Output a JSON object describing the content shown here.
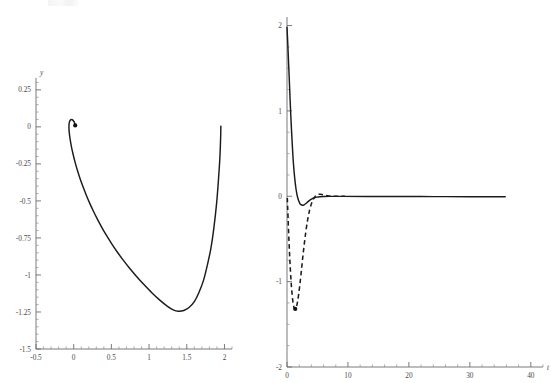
{
  "figure": {
    "background_color": "#ffffff",
    "axis_color": "#6b6b72",
    "curve_color": "#1b1b1e",
    "width": 551,
    "height": 383,
    "panel_count": 2
  },
  "chart_data": [
    {
      "id": "left-panel",
      "type": "line",
      "title": "",
      "subtitle": "",
      "xlabel": "",
      "ylabel": "y",
      "xlim": [
        -0.5,
        2.1
      ],
      "ylim": [
        -1.5,
        0.33
      ],
      "grid": false,
      "legend": null,
      "x_ticks_major": [
        -0.5,
        0,
        0.5,
        1,
        1.5,
        2
      ],
      "x_tick_labels": [
        "-0.5",
        "0",
        "0.5",
        "1",
        "1.5",
        "2"
      ],
      "x_minor_step": 0.1,
      "y_ticks_major": [
        -1.5,
        -1.25,
        -1,
        -0.75,
        -0.5,
        -0.25,
        0,
        0.25
      ],
      "y_tick_labels": [
        "-1.5",
        "-1.25",
        "-1",
        "-0.75",
        "-0.5",
        "-0.25",
        "0",
        "0.25"
      ],
      "y_minor_step": 0.05,
      "annotations": [
        {
          "name": "trajectory-endpoint-marker",
          "x": 0.02,
          "y": 0.01,
          "shape": "dot"
        }
      ],
      "series": [
        {
          "name": "phase-trajectory",
          "style": "solid",
          "color": "#1b1b1e",
          "points": [
            [
              0.02,
              0.012
            ],
            [
              0.006,
              0.034
            ],
            [
              -0.018,
              0.048
            ],
            [
              -0.042,
              0.047
            ],
            [
              -0.058,
              0.03
            ],
            [
              -0.063,
              0.002
            ],
            [
              -0.06,
              -0.034
            ],
            [
              -0.048,
              -0.081
            ],
            [
              -0.031,
              -0.131
            ],
            [
              -0.008,
              -0.185
            ],
            [
              0.019,
              -0.24
            ],
            [
              0.05,
              -0.295
            ],
            [
              0.085,
              -0.35
            ],
            [
              0.124,
              -0.405
            ],
            [
              0.166,
              -0.46
            ],
            [
              0.212,
              -0.515
            ],
            [
              0.262,
              -0.57
            ],
            [
              0.316,
              -0.625
            ],
            [
              0.374,
              -0.68
            ],
            [
              0.437,
              -0.735
            ],
            [
              0.505,
              -0.79
            ],
            [
              0.578,
              -0.845
            ],
            [
              0.657,
              -0.9
            ],
            [
              0.742,
              -0.955
            ],
            [
              0.834,
              -1.01
            ],
            [
              0.932,
              -1.065
            ],
            [
              1.036,
              -1.12
            ],
            [
              1.142,
              -1.17
            ],
            [
              1.24,
              -1.21
            ],
            [
              1.32,
              -1.236
            ],
            [
              1.39,
              -1.245
            ],
            [
              1.46,
              -1.24
            ],
            [
              1.53,
              -1.22
            ],
            [
              1.6,
              -1.18
            ],
            [
              1.66,
              -1.12
            ],
            [
              1.72,
              -1.04
            ],
            [
              1.77,
              -0.94
            ],
            [
              1.82,
              -0.82
            ],
            [
              1.86,
              -0.68
            ],
            [
              1.895,
              -0.52
            ],
            [
              1.92,
              -0.36
            ],
            [
              1.94,
              -0.2
            ],
            [
              1.95,
              -0.06
            ],
            [
              1.952,
              0.005
            ]
          ]
        }
      ]
    },
    {
      "id": "right-panel",
      "type": "line",
      "title": "",
      "subtitle": "",
      "xlabel": "t",
      "ylabel": "",
      "xlim": [
        0,
        42
      ],
      "ylim": [
        -2,
        2.1
      ],
      "grid": false,
      "legend": null,
      "x_ticks_major": [
        0,
        10,
        20,
        30,
        40
      ],
      "x_tick_labels": [
        "0",
        "10",
        "20",
        "30",
        "40"
      ],
      "x_minor_step": 2,
      "y_ticks_major": [
        -2,
        -1,
        0,
        1,
        2
      ],
      "y_tick_labels": [
        "-2",
        "-1",
        "0",
        "1",
        "2"
      ],
      "y_minor_step": 0.25,
      "annotations": [
        {
          "name": "dashed-curve-minimum-marker",
          "x": 1.35,
          "y": -1.32,
          "shape": "dot"
        }
      ],
      "series": [
        {
          "name": "solution-solid",
          "style": "solid",
          "color": "#1b1b1e",
          "points": [
            [
              0.0,
              1.98
            ],
            [
              0.12,
              1.8
            ],
            [
              0.25,
              1.58
            ],
            [
              0.38,
              1.36
            ],
            [
              0.5,
              1.15
            ],
            [
              0.62,
              0.95
            ],
            [
              0.75,
              0.76
            ],
            [
              0.88,
              0.59
            ],
            [
              1.0,
              0.44
            ],
            [
              1.15,
              0.3
            ],
            [
              1.3,
              0.19
            ],
            [
              1.45,
              0.1
            ],
            [
              1.6,
              0.035
            ],
            [
              1.75,
              -0.015
            ],
            [
              1.9,
              -0.05
            ],
            [
              2.1,
              -0.082
            ],
            [
              2.3,
              -0.098
            ],
            [
              2.55,
              -0.105
            ],
            [
              2.8,
              -0.1
            ],
            [
              3.1,
              -0.085
            ],
            [
              3.4,
              -0.066
            ],
            [
              3.75,
              -0.046
            ],
            [
              4.1,
              -0.03
            ],
            [
              4.5,
              -0.018
            ],
            [
              4.9,
              -0.01
            ],
            [
              5.4,
              -0.005
            ],
            [
              6.0,
              -0.002
            ],
            [
              7.0,
              -0.001
            ],
            [
              9.0,
              -0.001
            ],
            [
              13.0,
              -0.002
            ],
            [
              18.0,
              -0.003
            ],
            [
              24.0,
              -0.004
            ],
            [
              30.0,
              -0.005
            ],
            [
              35.8,
              -0.006
            ]
          ]
        },
        {
          "name": "derivative-dashed",
          "style": "dashed",
          "color": "#1b1b1e",
          "points": [
            [
              0.05,
              -0.02
            ],
            [
              0.1,
              -0.11
            ],
            [
              0.18,
              -0.26
            ],
            [
              0.26,
              -0.41
            ],
            [
              0.34,
              -0.55
            ],
            [
              0.43,
              -0.69
            ],
            [
              0.52,
              -0.82
            ],
            [
              0.62,
              -0.94
            ],
            [
              0.72,
              -1.05
            ],
            [
              0.84,
              -1.15
            ],
            [
              0.96,
              -1.23
            ],
            [
              1.1,
              -1.29
            ],
            [
              1.25,
              -1.318
            ],
            [
              1.4,
              -1.32
            ],
            [
              1.55,
              -1.295
            ],
            [
              1.72,
              -1.24
            ],
            [
              1.9,
              -1.155
            ],
            [
              2.1,
              -1.04
            ],
            [
              2.32,
              -0.9
            ],
            [
              2.55,
              -0.74
            ],
            [
              2.8,
              -0.58
            ],
            [
              3.08,
              -0.42
            ],
            [
              3.38,
              -0.28
            ],
            [
              3.7,
              -0.165
            ],
            [
              4.05,
              -0.08
            ],
            [
              4.4,
              -0.025
            ],
            [
              4.75,
              0.008
            ],
            [
              5.1,
              0.022
            ],
            [
              5.45,
              0.024
            ],
            [
              5.85,
              0.018
            ],
            [
              6.3,
              0.01
            ],
            [
              6.8,
              0.004
            ],
            [
              7.4,
              0.001
            ],
            [
              8.2,
              0.0
            ],
            [
              9.5,
              -0.001
            ]
          ]
        }
      ]
    }
  ]
}
